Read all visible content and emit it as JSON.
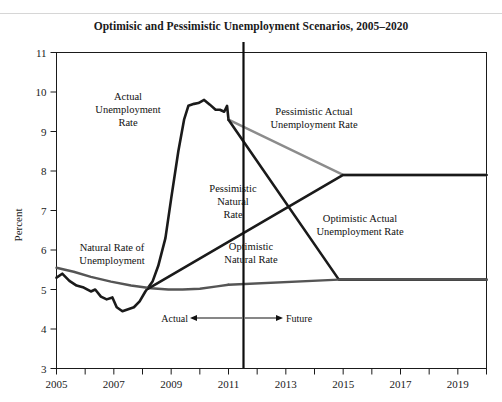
{
  "figure": {
    "title": "Optimisic and Pessimistic Unemployment Scenarios, 2005–2020"
  },
  "chart_data": {
    "type": "line",
    "title": "Optimisic and Pessimistic Unemployment Scenarios, 2005–2020",
    "xlabel": "",
    "ylabel": "Percent",
    "xlim": [
      2005,
      2020
    ],
    "ylim": [
      3,
      11
    ],
    "ytick_labels": [
      "3",
      "4",
      "5",
      "6",
      "7",
      "8",
      "9",
      "10",
      "11"
    ],
    "ytick_values": [
      3,
      4,
      5,
      6,
      7,
      8,
      9,
      10,
      11
    ],
    "xtick_labels": [
      "2005",
      "2007",
      "2009",
      "2011",
      "2013",
      "2015",
      "2017",
      "2019"
    ],
    "xtick_values": [
      2005,
      2007,
      2009,
      2011,
      2013,
      2015,
      2017,
      2019
    ],
    "xminor_values": [
      2006,
      2008,
      2010,
      2012,
      2014,
      2016,
      2018,
      2020
    ],
    "grid": false,
    "legend": "inline-labels",
    "divider_year": 2011,
    "divider_label_left": "Actual",
    "divider_label_right": "Future",
    "colors": {
      "actual": "#1a1a1a",
      "natural": "#555555",
      "pessimistic_actual": "#8c8c8c",
      "pessimistic_natural": "#1a1a1a",
      "optimistic_actual": "#1a1a1a",
      "optimistic_natural": "#555555"
    },
    "series": [
      {
        "name": "Actual Unemployment Rate",
        "label": "Actual\nUnemployment\nRate",
        "color": "#1a1a1a",
        "points": [
          [
            2005.0,
            5.3
          ],
          [
            2005.2,
            5.4
          ],
          [
            2005.45,
            5.22
          ],
          [
            2005.7,
            5.1
          ],
          [
            2005.95,
            5.05
          ],
          [
            2006.2,
            4.95
          ],
          [
            2006.35,
            5.0
          ],
          [
            2006.55,
            4.82
          ],
          [
            2006.75,
            4.75
          ],
          [
            2006.95,
            4.8
          ],
          [
            2007.1,
            4.55
          ],
          [
            2007.3,
            4.45
          ],
          [
            2007.5,
            4.5
          ],
          [
            2007.7,
            4.55
          ],
          [
            2007.9,
            4.7
          ],
          [
            2008.1,
            4.95
          ],
          [
            2008.35,
            5.2
          ],
          [
            2008.55,
            5.6
          ],
          [
            2008.8,
            6.3
          ],
          [
            2009.0,
            7.3
          ],
          [
            2009.25,
            8.5
          ],
          [
            2009.45,
            9.3
          ],
          [
            2009.6,
            9.65
          ],
          [
            2009.8,
            9.7
          ],
          [
            2009.95,
            9.72
          ],
          [
            2010.15,
            9.8
          ],
          [
            2010.35,
            9.68
          ],
          [
            2010.55,
            9.55
          ],
          [
            2010.7,
            9.55
          ],
          [
            2010.85,
            9.5
          ],
          [
            2010.95,
            9.65
          ],
          [
            2011.0,
            9.3
          ]
        ]
      },
      {
        "name": "Natural Rate of Unemployment",
        "label": "Natural Rate of\nUnemployment",
        "color": "#555555",
        "points": [
          [
            2005.0,
            5.55
          ],
          [
            2005.6,
            5.45
          ],
          [
            2006.2,
            5.32
          ],
          [
            2006.9,
            5.2
          ],
          [
            2007.6,
            5.1
          ],
          [
            2008.3,
            5.03
          ],
          [
            2008.9,
            5.0
          ],
          [
            2009.4,
            5.0
          ],
          [
            2010.0,
            5.02
          ],
          [
            2010.6,
            5.08
          ],
          [
            2011.0,
            5.12
          ]
        ]
      },
      {
        "name": "Pessimistic Actual Unemployment Rate",
        "label": "Pessimistic Actual\nUnemployment Rate",
        "color": "#8c8c8c",
        "points": [
          [
            2011.0,
            9.3
          ],
          [
            2015.0,
            7.9
          ],
          [
            2020.0,
            7.9
          ]
        ]
      },
      {
        "name": "Pessimistic Natural Rate",
        "label": "Pessimistic\nNatural\nRate",
        "color": "#1a1a1a",
        "points": [
          [
            2008.2,
            5.02
          ],
          [
            2015.0,
            7.9
          ],
          [
            2020.0,
            7.9
          ]
        ]
      },
      {
        "name": "Optimistic Actual Unemployment Rate",
        "label": "Optimistic Actual\nUnemployment Rate",
        "color": "#1a1a1a",
        "points": [
          [
            2011.0,
            9.3
          ],
          [
            2014.85,
            5.25
          ],
          [
            2020.0,
            5.25
          ]
        ]
      },
      {
        "name": "Optimistic Natural Rate",
        "label": "Optimistic Natural Rate",
        "color": "#555555",
        "points": [
          [
            2011.0,
            5.12
          ],
          [
            2014.85,
            5.25
          ],
          [
            2020.0,
            5.25
          ]
        ]
      }
    ],
    "annotations": [
      {
        "name": "actual-unemployment-rate-label",
        "lines": [
          "Actual",
          "Unemployment",
          "Rate"
        ],
        "x": 128,
        "y": 100
      },
      {
        "name": "natural-rate-label",
        "lines": [
          "Natural Rate of",
          "Unemployment"
        ],
        "x": 112,
        "y": 251
      },
      {
        "name": "pessimistic-actual-label",
        "lines": [
          "Pessimistic Actual",
          "Unemployment Rate"
        ],
        "x": 313,
        "y": 115
      },
      {
        "name": "pessimistic-natural-label",
        "lines": [
          "Pessimistic",
          "Natural",
          "Rate"
        ],
        "x": 233,
        "y": 192
      },
      {
        "name": "optimistic-actual-label",
        "lines": [
          "Optimistic Actual",
          "Unemployment Rate"
        ],
        "x": 359,
        "y": 222
      },
      {
        "name": "optimistic-natural-label",
        "lines": [
          "Optimistic",
          "Natural Rate"
        ],
        "x": 251,
        "y": 250
      },
      {
        "name": "actual-future-divider-label",
        "lines": [
          "Actual",
          "Future"
        ],
        "x": 225,
        "y": 318
      }
    ]
  },
  "axes": {
    "y_title": "Percent",
    "y_ticks": [
      "11",
      "10",
      "9",
      "8",
      "7",
      "6",
      "5",
      "4",
      "3"
    ],
    "x_ticks": [
      "2005",
      "2007",
      "2009",
      "2011",
      "2013",
      "2015",
      "2017",
      "2019"
    ]
  },
  "divider": {
    "left_label": "Actual",
    "right_label": "Future"
  },
  "labels": {
    "actual_unemployment_1": "Actual",
    "actual_unemployment_2": "Unemployment",
    "actual_unemployment_3": "Rate",
    "natural_rate_1": "Natural Rate of",
    "natural_rate_2": "Unemployment",
    "pessimistic_actual_1": "Pessimistic Actual",
    "pessimistic_actual_2": "Unemployment Rate",
    "pessimistic_natural_1": "Pessimistic",
    "pessimistic_natural_2": "Natural",
    "pessimistic_natural_3": "Rate",
    "optimistic_actual_1": "Optimistic Actual",
    "optimistic_actual_2": "Unemployment Rate",
    "optimistic_natural_1": "Optimistic",
    "optimistic_natural_2": "Natural Rate"
  }
}
